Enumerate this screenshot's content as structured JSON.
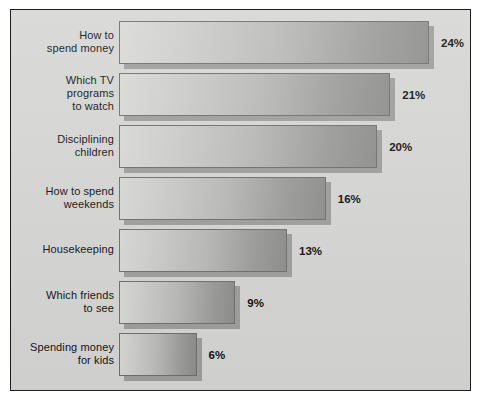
{
  "chart_data": {
    "type": "bar",
    "orientation": "horizontal",
    "title": "",
    "subtitle": "",
    "xlabel": "",
    "ylabel": "",
    "xlim": [
      0,
      24
    ],
    "grid": false,
    "legend": false,
    "value_suffix": "%",
    "categories": [
      "How to\nspend money",
      "Which TV\nprograms\nto watch",
      "Disciplining\nchildren",
      "How to spend\nweekends",
      "Housekeeping",
      "Which friends\nto see",
      "Spending money\nfor kids"
    ],
    "values": [
      24,
      21,
      20,
      16,
      13,
      9,
      6
    ],
    "value_labels": [
      "24%",
      "21%",
      "20%",
      "16%",
      "13%",
      "9%",
      "6%"
    ],
    "colors": {
      "plot_background": "#d6d6d4",
      "frame_border": "#1d1d1d",
      "bar_gradient_start": "#d9d9d7",
      "bar_gradient_end": "#8e8e8c",
      "bar_outline": "#6f6f6d",
      "bar_shadow": "#9e9e9c",
      "text": "#111111",
      "page_background": "#ffffff"
    }
  },
  "rows": [
    {
      "label": "How to\nspend money",
      "value_label": "24%",
      "width_pct": 100.0
    },
    {
      "label": "Which TV\nprograms\nto watch",
      "value_label": "21%",
      "width_pct": 87.5
    },
    {
      "label": "Disciplining\nchildren",
      "value_label": "20%",
      "width_pct": 83.3
    },
    {
      "label": "How to spend\nweekends",
      "value_label": "16%",
      "width_pct": 66.7
    },
    {
      "label": "Housekeeping",
      "value_label": "13%",
      "width_pct": 54.2
    },
    {
      "label": "Which friends\nto see",
      "value_label": "9%",
      "width_pct": 37.5
    },
    {
      "label": "Spending money\nfor kids",
      "value_label": "6%",
      "width_pct": 25.0
    }
  ]
}
